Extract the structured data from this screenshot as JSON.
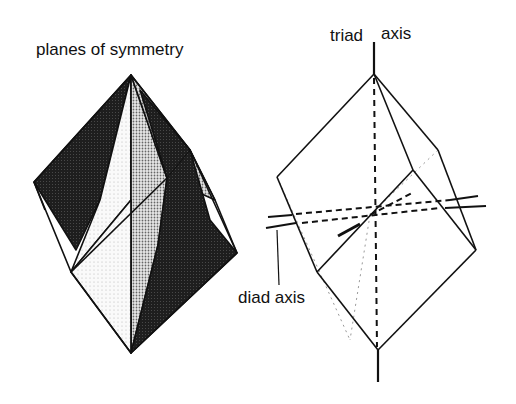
{
  "figures": {
    "left": {
      "label": "planes of symmetry"
    },
    "right": {
      "triad_left": "triad",
      "triad_right": "axis",
      "diad_label": "diad axis"
    }
  },
  "colors": {
    "ink": "#111111",
    "dark_fill": "#1c1c1c",
    "medium_fill": "#bdbdbd",
    "light_fill": "#ececec",
    "background": "#ffffff"
  }
}
